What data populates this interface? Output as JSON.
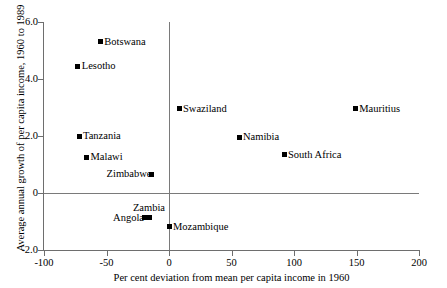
{
  "chart_data": {
    "type": "scatter",
    "title": "",
    "xlabel": "Per cent deviation from mean per capita income in 1960",
    "ylabel": "Average annual growth of per capita income, 1960 to 1989",
    "xlim": [
      -100,
      200
    ],
    "ylim": [
      -2.0,
      6.0
    ],
    "xticks": [
      "-100",
      "-50",
      "0",
      "50",
      "100",
      "150",
      "200"
    ],
    "xtick_values": [
      -100,
      -50,
      0,
      50,
      100,
      150,
      200
    ],
    "yticks": [
      "6.0",
      "4.0",
      "2.0",
      "0",
      "-2.0"
    ],
    "ytick_values": [
      6.0,
      4.0,
      2.0,
      0,
      -2.0
    ],
    "grid": false,
    "legend": null,
    "reference_lines": {
      "vertical_x": 0,
      "horizontal_y": 0
    },
    "marker_color": "#000000",
    "axis_color": "#6e6e6e",
    "points": [
      {
        "label": "Botswana",
        "x": -55,
        "y": 5.3,
        "label_pos": "right"
      },
      {
        "label": "Lesotho",
        "x": -73,
        "y": 4.45,
        "label_pos": "right"
      },
      {
        "label": "Swaziland",
        "x": 8,
        "y": 2.95,
        "label_pos": "right"
      },
      {
        "label": "Mauritius",
        "x": 149,
        "y": 2.95,
        "label_pos": "right"
      },
      {
        "label": "Tanzania",
        "x": -72,
        "y": 2.0,
        "label_pos": "right"
      },
      {
        "label": "Namibia",
        "x": 56,
        "y": 1.95,
        "label_pos": "right"
      },
      {
        "label": "South Africa",
        "x": 92,
        "y": 1.35,
        "label_pos": "right"
      },
      {
        "label": "Malawi",
        "x": -66,
        "y": 1.25,
        "label_pos": "right"
      },
      {
        "label": "Zimbabwe",
        "x": -14,
        "y": 0.66,
        "label_pos": "left"
      },
      {
        "label": "Zambia",
        "x": -16,
        "y": -0.85,
        "label_pos": "above"
      },
      {
        "label": "Angola",
        "x": -20,
        "y": -0.87,
        "label_pos": "left"
      },
      {
        "label": "Mozambique",
        "x": 0,
        "y": -1.18,
        "label_pos": "right"
      }
    ]
  }
}
